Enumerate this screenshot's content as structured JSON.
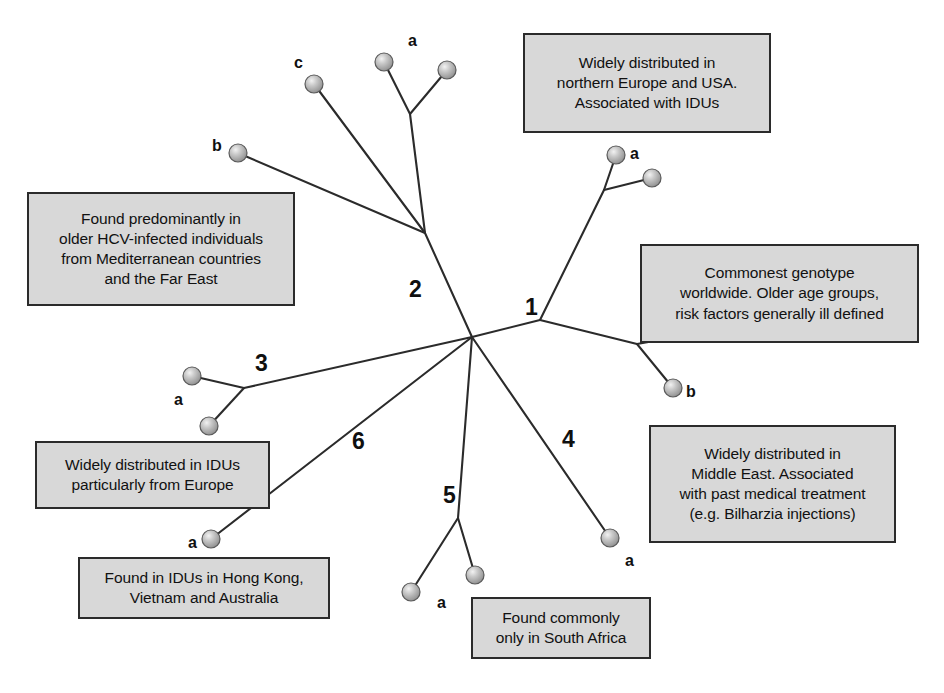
{
  "figure": {
    "type": "unrooted-phylogenetic-tree",
    "background_color": "#ffffff",
    "branch_color": "#2b2b2b",
    "node_fill": "#a6a6a6",
    "node_stroke": "#4a4a4a",
    "box_fill": "#d8d8d8",
    "box_border": "#2b2b2b",
    "text_color": "#101010"
  },
  "genotype_labels": [
    {
      "id": "genotype-1",
      "text": "1",
      "x": 525,
      "y": 296
    },
    {
      "id": "genotype-2",
      "text": "2",
      "x": 409,
      "y": 278
    },
    {
      "id": "genotype-3",
      "text": "3",
      "x": 255,
      "y": 352
    },
    {
      "id": "genotype-4",
      "text": "4",
      "x": 562,
      "y": 428
    },
    {
      "id": "genotype-5",
      "text": "5",
      "x": 443,
      "y": 484
    },
    {
      "id": "genotype-6",
      "text": "6",
      "x": 352,
      "y": 430
    }
  ],
  "tip_labels": [
    {
      "id": "tip-label-2a",
      "text": "a",
      "x": 408,
      "y": 33
    },
    {
      "id": "tip-label-2c",
      "text": "c",
      "x": 294,
      "y": 55
    },
    {
      "id": "tip-label-2b",
      "text": "b",
      "x": 212,
      "y": 138
    },
    {
      "id": "tip-label-1a",
      "text": "a",
      "x": 630,
      "y": 146
    },
    {
      "id": "tip-label-1b",
      "text": "b",
      "x": 686,
      "y": 384
    },
    {
      "id": "tip-label-3a",
      "text": "a",
      "x": 174,
      "y": 392
    },
    {
      "id": "tip-label-6a",
      "text": "a",
      "x": 188,
      "y": 535
    },
    {
      "id": "tip-label-4a",
      "text": "a",
      "x": 625,
      "y": 553
    },
    {
      "id": "tip-label-5a",
      "text": "a",
      "x": 437,
      "y": 595
    }
  ],
  "annotation_boxes": [
    {
      "id": "annotation-genotype-1-north",
      "genotype": "1a",
      "lines": [
        "Widely distributed in",
        "northern Europe and USA.",
        "Associated with IDUs"
      ],
      "x": 523,
      "y": 33,
      "w": 248,
      "h": 100
    },
    {
      "id": "annotation-genotype-2",
      "genotype": "2",
      "lines": [
        "Found predominantly in",
        "older HCV-infected individuals",
        "from Mediterranean countries",
        "and the Far East"
      ],
      "x": 27,
      "y": 192,
      "w": 268,
      "h": 114
    },
    {
      "id": "annotation-genotype-1",
      "genotype": "1",
      "lines": [
        "Commonest genotype",
        "worldwide. Older age groups,",
        "risk factors generally ill defined"
      ],
      "x": 640,
      "y": 244,
      "w": 279,
      "h": 99
    },
    {
      "id": "annotation-genotype-3",
      "genotype": "3",
      "lines": [
        "Widely distributed in IDUs",
        "particularly from Europe"
      ],
      "x": 35,
      "y": 441,
      "w": 235,
      "h": 68
    },
    {
      "id": "annotation-genotype-4",
      "genotype": "4",
      "lines": [
        "Widely distributed in",
        "Middle East. Associated",
        "with past medical treatment",
        "(e.g. Bilharzia injections)"
      ],
      "x": 649,
      "y": 425,
      "w": 247,
      "h": 118
    },
    {
      "id": "annotation-genotype-6",
      "genotype": "6",
      "lines": [
        "Found in IDUs in Hong Kong,",
        "Vietnam and Australia"
      ],
      "x": 78,
      "y": 557,
      "w": 252,
      "h": 62
    },
    {
      "id": "annotation-genotype-5",
      "genotype": "5",
      "lines": [
        "Found commonly",
        "only in South Africa"
      ],
      "x": 471,
      "y": 597,
      "w": 180,
      "h": 62
    }
  ],
  "tree": {
    "center": {
      "x": 472,
      "y": 337
    },
    "internal_nodes": [
      {
        "id": "node-center",
        "x": 472,
        "y": 337
      },
      {
        "id": "node-genotype-1",
        "x": 540,
        "y": 320
      },
      {
        "id": "node-genotype-1a",
        "x": 604,
        "y": 190
      },
      {
        "id": "node-genotype-1b",
        "x": 637,
        "y": 344
      },
      {
        "id": "node-genotype-2",
        "x": 425,
        "y": 233
      },
      {
        "id": "node-genotype-2a",
        "x": 410,
        "y": 114
      },
      {
        "id": "node-genotype-3",
        "x": 244,
        "y": 388
      },
      {
        "id": "node-genotype-5",
        "x": 458,
        "y": 518
      }
    ],
    "tips": [
      {
        "id": "tip-2a-1",
        "x": 384,
        "y": 62
      },
      {
        "id": "tip-2a-2",
        "x": 447,
        "y": 70
      },
      {
        "id": "tip-2c",
        "x": 314,
        "y": 84
      },
      {
        "id": "tip-2b",
        "x": 238,
        "y": 153
      },
      {
        "id": "tip-1a-1",
        "x": 616,
        "y": 155
      },
      {
        "id": "tip-1a-2",
        "x": 652,
        "y": 178
      },
      {
        "id": "tip-1b-1",
        "x": 700,
        "y": 333
      },
      {
        "id": "tip-1b-2",
        "x": 673,
        "y": 388
      },
      {
        "id": "tip-3a-1",
        "x": 192,
        "y": 376
      },
      {
        "id": "tip-3a-2",
        "x": 209,
        "y": 426
      },
      {
        "id": "tip-6a",
        "x": 211,
        "y": 539
      },
      {
        "id": "tip-4a",
        "x": 610,
        "y": 538
      },
      {
        "id": "tip-5a-1",
        "x": 411,
        "y": 592
      },
      {
        "id": "tip-5a-2",
        "x": 475,
        "y": 575
      }
    ],
    "branches": [
      [
        "node-center",
        "node-genotype-1"
      ],
      [
        "node-genotype-1",
        "node-genotype-1a"
      ],
      [
        "node-genotype-1a",
        "tip-1a-1"
      ],
      [
        "node-genotype-1a",
        "tip-1a-2"
      ],
      [
        "node-genotype-1",
        "node-genotype-1b"
      ],
      [
        "node-genotype-1b",
        "tip-1b-1"
      ],
      [
        "node-genotype-1b",
        "tip-1b-2"
      ],
      [
        "node-center",
        "node-genotype-2"
      ],
      [
        "node-genotype-2",
        "node-genotype-2a"
      ],
      [
        "node-genotype-2a",
        "tip-2a-1"
      ],
      [
        "node-genotype-2a",
        "tip-2a-2"
      ],
      [
        "node-genotype-2",
        "tip-2c"
      ],
      [
        "node-genotype-2",
        "tip-2b"
      ],
      [
        "node-center",
        "node-genotype-3"
      ],
      [
        "node-genotype-3",
        "tip-3a-1"
      ],
      [
        "node-genotype-3",
        "tip-3a-2"
      ],
      [
        "node-center",
        "tip-6a"
      ],
      [
        "node-center",
        "tip-4a"
      ],
      [
        "node-center",
        "node-genotype-5"
      ],
      [
        "node-genotype-5",
        "tip-5a-1"
      ],
      [
        "node-genotype-5",
        "tip-5a-2"
      ]
    ]
  }
}
